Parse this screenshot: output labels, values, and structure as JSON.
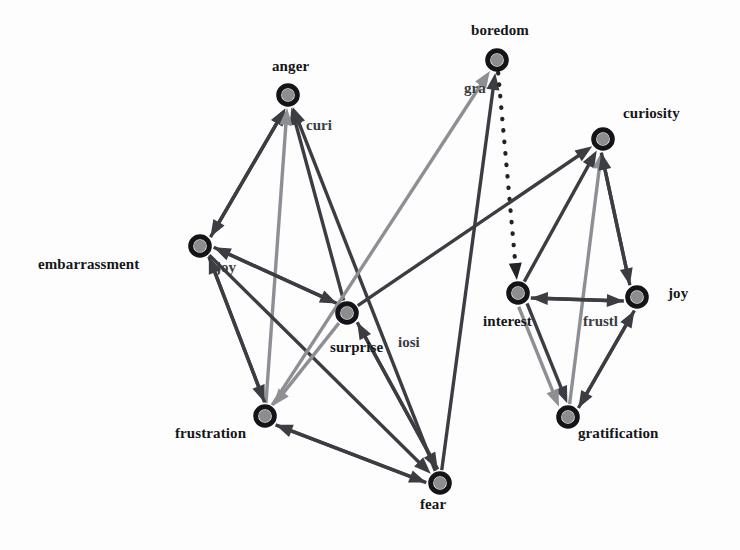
{
  "diagram": {
    "type": "directed-graph",
    "background_color": "#fdfdfd",
    "node_ring_color": "#141418",
    "node_fill_color": "#8d8d8d",
    "edge_colors": {
      "dark": "#3c3d42",
      "gray": "#8e8f94",
      "dotted": "#232327"
    },
    "nodes": [
      {
        "id": "anger",
        "label": "anger",
        "x": 288,
        "y": 95,
        "label_x": 272,
        "label_y": 58,
        "label_align": "center"
      },
      {
        "id": "boredom",
        "label": "boredom",
        "x": 497,
        "y": 60,
        "label_x": 471,
        "label_y": 22,
        "label_align": "center"
      },
      {
        "id": "curiosity",
        "label": "curiosity",
        "x": 603,
        "y": 139,
        "label_x": 623,
        "label_y": 105,
        "label_align": "left"
      },
      {
        "id": "embarrassment",
        "label": "embarrassment",
        "x": 200,
        "y": 246,
        "label_x": 38,
        "label_y": 256,
        "label_align": "left"
      },
      {
        "id": "surprise",
        "label": "surprise",
        "x": 347,
        "y": 313,
        "label_x": 330,
        "label_y": 339,
        "label_align": "center"
      },
      {
        "id": "interest",
        "label": "interest",
        "x": 518,
        "y": 293,
        "label_x": 483,
        "label_y": 313,
        "label_align": "left"
      },
      {
        "id": "joy_right",
        "label": "joy",
        "x": 637,
        "y": 297,
        "label_x": 668,
        "label_y": 285,
        "label_align": "left"
      },
      {
        "id": "frustration_left",
        "label": "frustration",
        "x": 265,
        "y": 416,
        "label_x": 175,
        "label_y": 425,
        "label_align": "left"
      },
      {
        "id": "gratification",
        "label": "gratification",
        "x": 568,
        "y": 417,
        "label_x": 578,
        "label_y": 425,
        "label_align": "left"
      },
      {
        "id": "fear",
        "label": "fear",
        "x": 440,
        "y": 483,
        "label_x": 420,
        "label_y": 496,
        "label_align": "center"
      }
    ],
    "overlay_labels": [
      {
        "id": "curi_clipped",
        "text": "curi",
        "x": 306,
        "y": 117
      },
      {
        "id": "gra_clipped",
        "text": "gra",
        "x": 464,
        "y": 80
      },
      {
        "id": "joy_clipped",
        "text": "joy",
        "x": 216,
        "y": 259
      },
      {
        "id": "iosi_clipped",
        "text": "iosi",
        "x": 398,
        "y": 334
      },
      {
        "id": "frustl_clipped",
        "text": "frustl",
        "x": 583,
        "y": 313
      }
    ],
    "edges": [
      {
        "from": "anger",
        "to": "embarrassment",
        "color": "dark",
        "style": "solid",
        "arrow": "both"
      },
      {
        "from": "embarrassment",
        "to": "anger",
        "color": "dark",
        "style": "solid",
        "arrow": "end"
      },
      {
        "from": "surprise",
        "to": "anger",
        "color": "dark",
        "style": "solid",
        "arrow": "end"
      },
      {
        "from": "frustration_left",
        "to": "anger",
        "color": "gray",
        "style": "solid",
        "arrow": "end"
      },
      {
        "from": "fear",
        "to": "anger",
        "color": "dark",
        "style": "solid",
        "arrow": "end"
      },
      {
        "from": "embarrassment",
        "to": "surprise",
        "color": "dark",
        "style": "solid",
        "arrow": "end"
      },
      {
        "from": "embarrassment",
        "to": "frustration_left",
        "color": "dark",
        "style": "solid",
        "arrow": "end"
      },
      {
        "from": "embarrassment",
        "to": "fear",
        "color": "dark",
        "style": "solid",
        "arrow": "end"
      },
      {
        "from": "surprise",
        "to": "embarrassment",
        "color": "dark",
        "style": "solid",
        "arrow": "end"
      },
      {
        "from": "frustration_left",
        "to": "embarrassment",
        "color": "dark",
        "style": "solid",
        "arrow": "end"
      },
      {
        "from": "surprise",
        "to": "frustration_left",
        "color": "gray",
        "style": "solid",
        "arrow": "end"
      },
      {
        "from": "surprise",
        "to": "fear",
        "color": "dark",
        "style": "solid",
        "arrow": "end"
      },
      {
        "from": "fear",
        "to": "surprise",
        "color": "dark",
        "style": "solid",
        "arrow": "end"
      },
      {
        "from": "fear",
        "to": "frustration_left",
        "color": "dark",
        "style": "solid",
        "arrow": "end"
      },
      {
        "from": "frustration_left",
        "to": "fear",
        "color": "dark",
        "style": "solid",
        "arrow": "end"
      },
      {
        "from": "fear",
        "to": "boredom",
        "color": "dark",
        "style": "solid",
        "arrow": "end"
      },
      {
        "from": "frustration_left",
        "to": "boredom",
        "color": "gray",
        "style": "solid",
        "arrow": "end"
      },
      {
        "from": "boredom",
        "to": "interest",
        "color": "dotted",
        "style": "dotted",
        "arrow": "end"
      },
      {
        "from": "surprise",
        "to": "curiosity",
        "color": "dark",
        "style": "solid",
        "arrow": "end"
      },
      {
        "from": "interest",
        "to": "curiosity",
        "color": "dark",
        "style": "solid",
        "arrow": "end"
      },
      {
        "from": "gratification",
        "to": "curiosity",
        "color": "gray",
        "style": "solid",
        "arrow": "end"
      },
      {
        "from": "joy_right",
        "to": "curiosity",
        "color": "dark",
        "style": "solid",
        "arrow": "end"
      },
      {
        "from": "curiosity",
        "to": "joy_right",
        "color": "dark",
        "style": "solid",
        "arrow": "end"
      },
      {
        "from": "joy_right",
        "to": "interest",
        "color": "dark",
        "style": "solid",
        "arrow": "end"
      },
      {
        "from": "interest",
        "to": "joy_right",
        "color": "dark",
        "style": "solid",
        "arrow": "end"
      },
      {
        "from": "interest",
        "to": "gratification",
        "color": "dark",
        "style": "solid",
        "arrow": "end"
      },
      {
        "from": "joy_right",
        "to": "gratification",
        "color": "dark",
        "style": "solid",
        "arrow": "end"
      },
      {
        "from": "gratification",
        "to": "joy_right",
        "color": "dark",
        "style": "solid",
        "arrow": "end"
      },
      {
        "from": "interest",
        "to": "gratification",
        "color": "gray",
        "style": "solid",
        "arrow": "end"
      }
    ]
  }
}
